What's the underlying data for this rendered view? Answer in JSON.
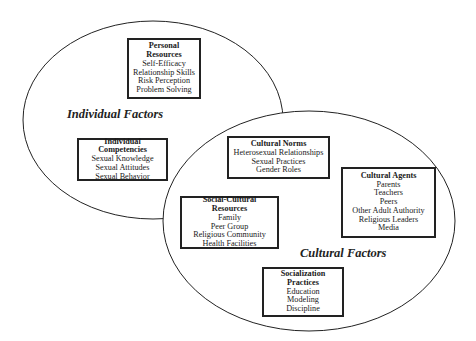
{
  "diagram": {
    "regions": [
      {
        "id": "individual",
        "label": "Individual Factors"
      },
      {
        "id": "cultural",
        "label": "Cultural Factors"
      }
    ],
    "boxes": {
      "personal_resources": {
        "title_line1": "Personal",
        "title_line2": "Resources",
        "items": [
          "Self-Efficacy",
          "Relationship Skills",
          "Risk Perception",
          "Problem Solving"
        ]
      },
      "individual_competencies": {
        "title": "Individual Competencies",
        "items": [
          "Sexual Knowledge",
          "Sexual Attitudes",
          "Sexual Behavior"
        ]
      },
      "cultural_norms": {
        "title": "Cultural Norms",
        "items": [
          "Heterosexual Relationships",
          "Sexual Practices",
          "Gender Roles"
        ]
      },
      "cultural_agents": {
        "title": "Cultural Agents",
        "items": [
          "Parents",
          "Teachers",
          "Peers",
          "Other Adult Authority",
          "Religious Leaders",
          "Media"
        ]
      },
      "social_cultural_resources": {
        "title": "Social-Cultural Resources",
        "items": [
          "Family",
          "Peer Group",
          "Religious Community",
          "Health Facilities"
        ]
      },
      "socialization_practices": {
        "title_line1": "Socialization",
        "title_line2": "Practices",
        "items": [
          "Education",
          "Modeling",
          "Discipline"
        ]
      }
    },
    "colors": {
      "line": "#222222",
      "background": "#ffffff"
    }
  }
}
